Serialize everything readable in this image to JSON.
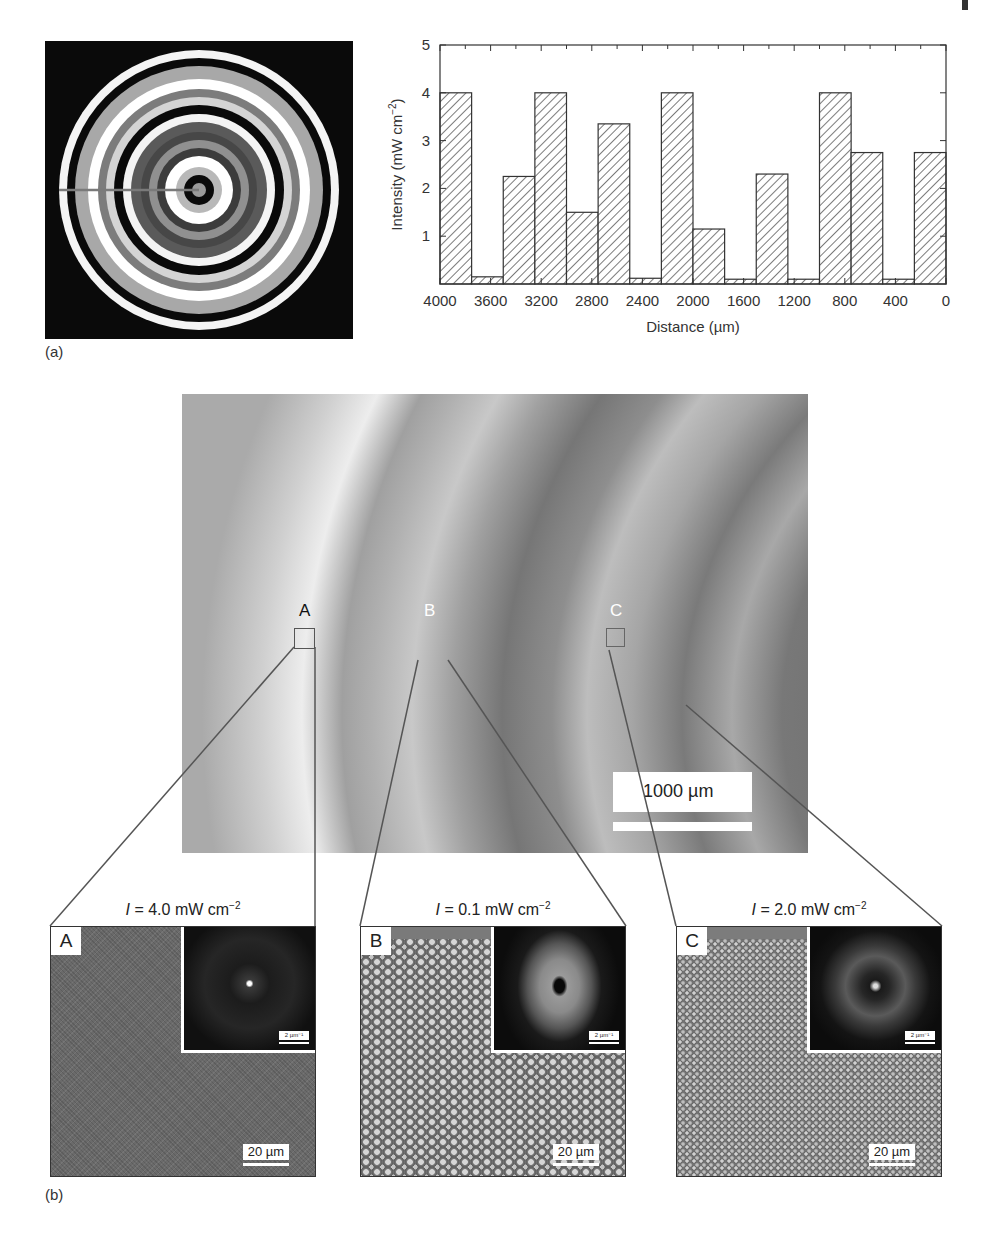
{
  "figure": {
    "panel_a_label": "(a)",
    "panel_b_label": "(b)"
  },
  "ring_pattern": {
    "description": "concentric intensity mask rings",
    "rings_outer_to_inner": [
      {
        "r": 140,
        "color": "#f4f4f4"
      },
      {
        "r": 132,
        "color": "#0a0a0a"
      },
      {
        "r": 124,
        "color": "#a8a8a8"
      },
      {
        "r": 111,
        "color": "#ffffff"
      },
      {
        "r": 101,
        "color": "#7c7c7c"
      },
      {
        "r": 93,
        "color": "#d4d4d4"
      },
      {
        "r": 85,
        "color": "#0a0a0a"
      },
      {
        "r": 76,
        "color": "#f4f4f4"
      },
      {
        "r": 68,
        "color": "#5a5a5a"
      },
      {
        "r": 58,
        "color": "#474747"
      },
      {
        "r": 50,
        "color": "#909090"
      },
      {
        "r": 42,
        "color": "#3c3c3c"
      },
      {
        "r": 34,
        "color": "#ffffff"
      },
      {
        "r": 23,
        "color": "#b8b8b8"
      },
      {
        "r": 15,
        "color": "#0a0a0a"
      },
      {
        "r": 7,
        "color": "#9a9a9a"
      }
    ],
    "radial_line_color": "#7a7a7a"
  },
  "chart_data": {
    "type": "bar",
    "title": "",
    "xlabel": "Distance (µm)",
    "ylabel": "Intensity (mW cm⁻²)",
    "ylabel_main": "Intensity (mW cm",
    "ylabel_sup": "−2",
    "ylabel_tail": ")",
    "x_direction": "reversed",
    "xlim": [
      4000,
      0
    ],
    "ylim": [
      0,
      5
    ],
    "x_ticks": [
      "4000",
      "3600",
      "3200",
      "2800",
      "2400",
      "2000",
      "1600",
      "1200",
      "800",
      "400",
      "0"
    ],
    "y_ticks": [
      "1",
      "2",
      "3",
      "4",
      "5"
    ],
    "bar_width_um": 250,
    "bin_edges_um": [
      4000,
      3750,
      3500,
      3250,
      3000,
      2750,
      2500,
      2250,
      2000,
      1750,
      1500,
      1250,
      1000,
      750,
      500,
      250,
      0
    ],
    "values": [
      4.0,
      0.15,
      2.25,
      4.0,
      1.5,
      3.35,
      0.12,
      4.0,
      1.15,
      0.1,
      2.3,
      0.1,
      4.0,
      2.75,
      0.1,
      2.75
    ],
    "fill": "diagonal hatch",
    "grid": false,
    "legend": null
  },
  "micrograph": {
    "regions": [
      {
        "label": "A"
      },
      {
        "label": "B"
      },
      {
        "label": "C"
      }
    ],
    "scale_bar": "1000 µm"
  },
  "zoom_panels": [
    {
      "letter": "A",
      "intensity_prefix": "I",
      "intensity_value": " = 4.0 mW cm",
      "intensity_sup": "−2",
      "fft_scale": "2 µm⁻¹",
      "scale": "20 µm"
    },
    {
      "letter": "B",
      "intensity_prefix": "I",
      "intensity_value": " = 0.1 mW cm",
      "intensity_sup": "−2",
      "fft_scale": "2 µm⁻¹",
      "scale": "20 µm"
    },
    {
      "letter": "C",
      "intensity_prefix": "I",
      "intensity_value": " = 2.0 mW cm",
      "intensity_sup": "−2",
      "fft_scale": "2 µm⁻¹",
      "scale": "20 µm"
    }
  ]
}
